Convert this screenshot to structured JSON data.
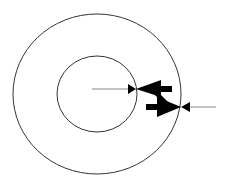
{
  "diagram": {
    "colors": {
      "stroke": "#333333",
      "fill": "#000000",
      "background": "#ffffff"
    },
    "outer_circle": {
      "cx": 97,
      "cy": 94,
      "rx": 84,
      "ry": 80
    },
    "inner_circle": {
      "cx": 97,
      "cy": 94,
      "rx": 40,
      "ry": 38
    },
    "inner_radius_arrow": {
      "leader_line": {
        "x1": 92,
        "y1": 89,
        "x2": 128,
        "y2": 89
      },
      "small_head_tip": {
        "x": 136,
        "y": 89,
        "direction": "right"
      },
      "large_head_tip": {
        "x": 136,
        "y": 89,
        "direction": "left"
      }
    },
    "outer_radius_arrow": {
      "leader_line": {
        "x1": 190,
        "y1": 107,
        "x2": 216,
        "y2": 107
      },
      "small_head_tip": {
        "x": 181,
        "y": 107,
        "direction": "left"
      },
      "large_head_tip": {
        "x": 181,
        "y": 107,
        "direction": "right"
      }
    }
  }
}
